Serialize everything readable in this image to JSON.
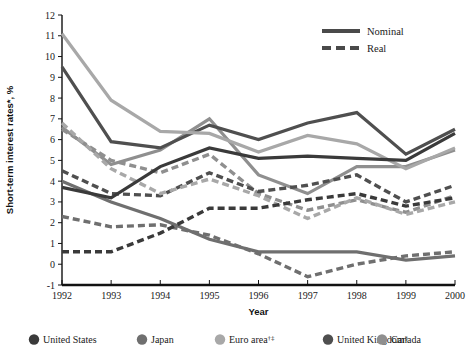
{
  "chart_data": {
    "type": "line",
    "title": "",
    "xlabel": "Year",
    "ylabel": "Short-term interest rates*, %",
    "x": [
      1992,
      1993,
      1994,
      1995,
      1996,
      1997,
      1998,
      1999,
      2000
    ],
    "xlim": [
      1992,
      2000
    ],
    "ylim": [
      -1,
      12
    ],
    "ytick_labels": [
      "12",
      "11",
      "10",
      "9",
      "8",
      "7",
      "6",
      "5",
      "4",
      "3",
      "2",
      "1",
      "0",
      "-1"
    ],
    "xtick_labels": [
      "1992",
      "1993",
      "1994",
      "1995",
      "1996",
      "1997",
      "1998",
      "1999",
      "2000"
    ],
    "grid": false,
    "legend_position": "bottom",
    "style_legend": {
      "position": "top-right",
      "entries": [
        {
          "label": "Nominal",
          "style": "solid"
        },
        {
          "label": "Real",
          "style": "dashed"
        }
      ]
    },
    "series": [
      {
        "name": "United States",
        "kind": "Nominal",
        "style": "solid",
        "color": "#3a3a3a",
        "values": [
          3.7,
          3.2,
          4.7,
          5.6,
          5.1,
          5.2,
          5.1,
          5.0,
          6.3
        ]
      },
      {
        "name": "United States",
        "kind": "Real",
        "style": "dashed",
        "color": "#3a3a3a",
        "values": [
          0.6,
          0.6,
          1.5,
          2.7,
          2.7,
          3.1,
          3.4,
          2.8,
          3.2
        ]
      },
      {
        "name": "Japan",
        "kind": "Nominal",
        "style": "solid",
        "color": "#6f6f6f",
        "values": [
          4.0,
          3.0,
          2.2,
          1.2,
          0.6,
          0.6,
          0.6,
          0.2,
          0.4
        ]
      },
      {
        "name": "Japan",
        "kind": "Real",
        "style": "dashed",
        "color": "#6f6f6f",
        "values": [
          2.3,
          1.8,
          1.9,
          1.4,
          0.5,
          -0.6,
          0.0,
          0.4,
          0.6
        ]
      },
      {
        "name": "Euro area",
        "kind": "Nominal",
        "style": "solid",
        "color": "#a8a8a8",
        "values": [
          11.1,
          7.9,
          6.4,
          6.3,
          5.4,
          6.2,
          5.8,
          4.6,
          5.6
        ]
      },
      {
        "name": "Euro area",
        "kind": "Real",
        "style": "dashed",
        "color": "#a8a8a8",
        "values": [
          6.8,
          4.6,
          3.4,
          4.1,
          3.3,
          2.2,
          3.2,
          2.4,
          3.0
        ]
      },
      {
        "name": "United Kingdom",
        "kind": "Nominal",
        "style": "solid",
        "color": "#4f4f4f",
        "values": [
          9.5,
          5.9,
          5.6,
          6.7,
          6.0,
          6.8,
          7.3,
          5.3,
          6.5
        ]
      },
      {
        "name": "United Kingdom",
        "kind": "Real",
        "style": "dashed",
        "color": "#4f4f4f",
        "values": [
          4.5,
          3.4,
          3.3,
          4.4,
          3.5,
          3.8,
          4.3,
          3.0,
          3.8
        ]
      },
      {
        "name": "Canada",
        "kind": "Nominal",
        "style": "solid",
        "color": "#8f8f8f",
        "values": [
          6.6,
          4.8,
          5.5,
          7.0,
          4.3,
          3.4,
          4.7,
          4.7,
          5.5
        ]
      },
      {
        "name": "Canada",
        "kind": "Real",
        "style": "dashed",
        "color": "#8f8f8f",
        "values": [
          6.5,
          5.0,
          4.4,
          5.3,
          3.4,
          2.6,
          3.1,
          2.5,
          3.3
        ]
      }
    ]
  },
  "legend": {
    "items": [
      {
        "label": "United States",
        "sup": "",
        "color": "#3a3a3a"
      },
      {
        "label": "Japan",
        "sup": "",
        "color": "#6f6f6f"
      },
      {
        "label": "Euro area",
        "sup": "†‡",
        "color": "#a8a8a8"
      },
      {
        "label": "United Kingdom",
        "sup": "§",
        "color": "#4f4f4f"
      },
      {
        "label": "Canada",
        "sup": "",
        "color": "#8f8f8f"
      }
    ]
  }
}
